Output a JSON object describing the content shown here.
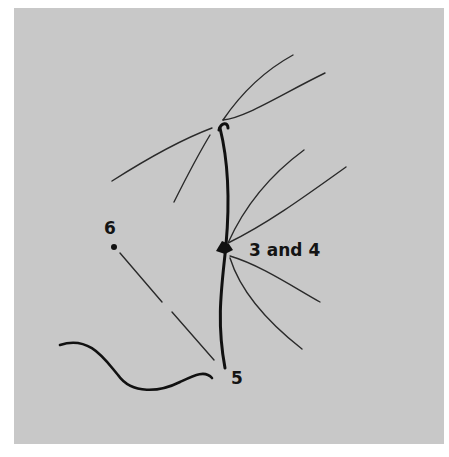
{
  "figure": {
    "background_color": "#c8c8c8",
    "line_color": "#1a1a1a",
    "labels": {
      "point_6": "6",
      "point_3_4": "3 and 4",
      "point_5": "5"
    }
  }
}
